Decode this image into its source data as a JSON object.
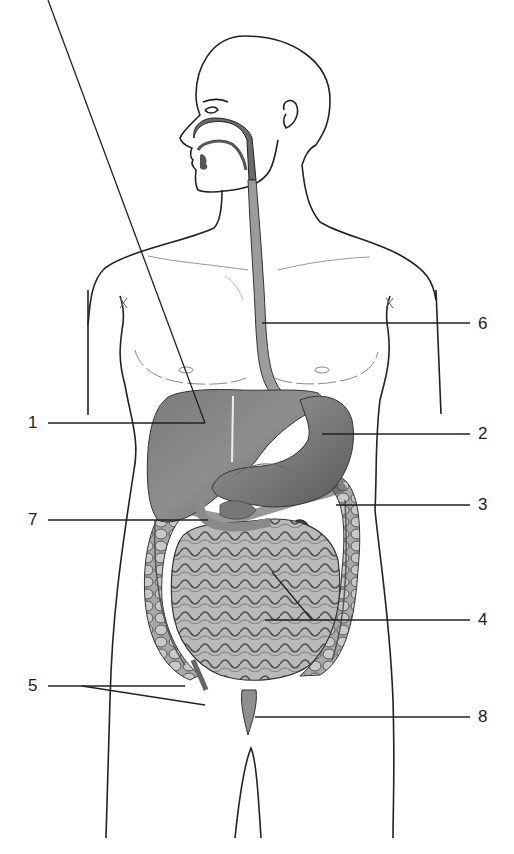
{
  "diagram": {
    "labels": [
      {
        "id": "1",
        "text": "1",
        "x": 28,
        "y": 413
      },
      {
        "id": "2",
        "text": "2",
        "x": 478,
        "y": 425
      },
      {
        "id": "3",
        "text": "3",
        "x": 478,
        "y": 497
      },
      {
        "id": "4",
        "text": "4",
        "x": 478,
        "y": 611
      },
      {
        "id": "5",
        "text": "5",
        "x": 28,
        "y": 674
      },
      {
        "id": "6",
        "text": "6",
        "x": 478,
        "y": 315
      },
      {
        "id": "7",
        "text": "7",
        "x": 28,
        "y": 510
      },
      {
        "id": "8",
        "text": "8",
        "x": 478,
        "y": 707
      }
    ],
    "colors": {
      "outline": "#222222",
      "organ_dark": "#6e6e6e",
      "organ_mid": "#9a9a9a",
      "organ_light": "#c8c8c8",
      "background": "#ffffff"
    }
  }
}
